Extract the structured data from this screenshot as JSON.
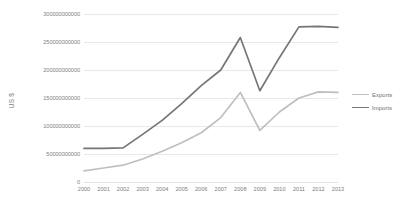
{
  "chart_data": {
    "type": "line",
    "title": "",
    "xlabel": "",
    "ylabel": "US $",
    "categories": [
      "2000",
      "2001",
      "2002",
      "2003",
      "2004",
      "2005",
      "2006",
      "2007",
      "2008",
      "2009",
      "2010",
      "2011",
      "2012",
      "2013"
    ],
    "ylim": [
      0,
      300000000000
    ],
    "y_ticks": [
      0,
      50000000000,
      100000000000,
      150000000000,
      200000000000,
      250000000000,
      300000000000
    ],
    "y_tick_labels": [
      "0",
      "50000000000",
      "100000000000",
      "150000000000",
      "200000000000",
      "250000000000",
      "300000000000"
    ],
    "grid": true,
    "legend_position": "right",
    "series": [
      {
        "name": "Exports",
        "color": "#bfbfbf",
        "values": [
          20000000000,
          25000000000,
          30000000000,
          41000000000,
          55000000000,
          70000000000,
          88000000000,
          115000000000,
          160000000000,
          92000000000,
          125000000000,
          150000000000,
          161000000000,
          160000000000
        ]
      },
      {
        "name": "Imports",
        "color": "#767676",
        "values": [
          60000000000,
          60000000000,
          61000000000,
          85000000000,
          110000000000,
          140000000000,
          172000000000,
          200000000000,
          258000000000,
          163000000000,
          222000000000,
          277000000000,
          278000000000,
          276000000000
        ]
      }
    ]
  },
  "legend": {
    "entries": [
      {
        "label": "Exports"
      },
      {
        "label": "Imports"
      }
    ]
  },
  "colors": {
    "exports": "#bfbfbf",
    "imports": "#767676",
    "gridline": "#e8e8e8",
    "tick_text": "#808080",
    "background": "#ffffff"
  }
}
